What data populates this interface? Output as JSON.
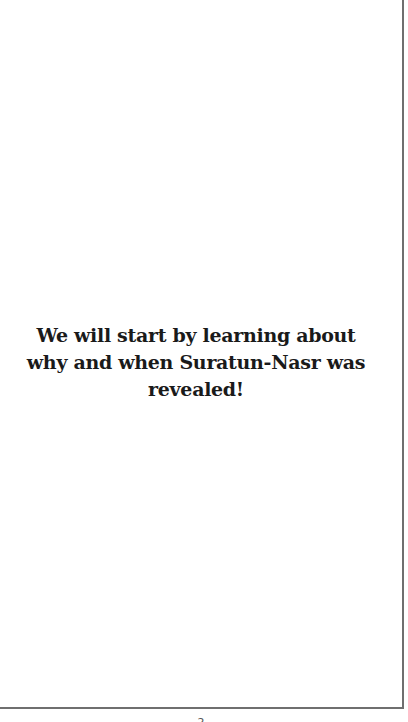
{
  "page": {
    "text_lines": [
      "We will start by learning about",
      "why and when Suratun-Nasr was",
      "revealed!"
    ],
    "page_number": "2"
  },
  "colors": {
    "background": "#ffffff",
    "text": "#1a1a1a",
    "border": "#6f6f6f"
  }
}
